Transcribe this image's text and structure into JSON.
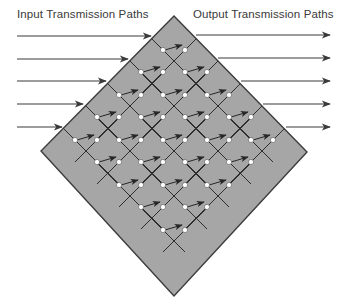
{
  "labels": {
    "input": "Input Transmission Paths",
    "output": "Output Transmission Paths"
  },
  "colors": {
    "background": "#ffffff",
    "diamond_fill": "#a6a6a6",
    "diamond_stroke": "#3c3c3c",
    "line": "#2e2e2e",
    "arrow": "#262626",
    "input_arrow": "#3a3a3a",
    "output_arrow": "#3a3a3a",
    "node_fill": "#ffffff",
    "node_stroke": "#555555"
  },
  "diamond": {
    "top": [
      174,
      16
    ],
    "right": [
      307,
      152
    ],
    "bottom": [
      174,
      296
    ],
    "left": [
      41,
      151
    ]
  },
  "input_paths": [
    {
      "y": 36,
      "x_start": 17,
      "x_end": 151,
      "edge_x": 154
    },
    {
      "y": 59,
      "x_start": 17,
      "x_end": 128,
      "edge_x": 132
    },
    {
      "y": 81,
      "x_start": 17,
      "x_end": 106,
      "edge_x": 110
    },
    {
      "y": 104,
      "x_start": 17,
      "x_end": 83,
      "edge_x": 88
    },
    {
      "y": 127,
      "x_start": 17,
      "x_end": 62,
      "edge_x": 65
    }
  ],
  "output_paths": [
    {
      "y": 35,
      "x_start": 196,
      "x_end": 330
    },
    {
      "y": 58,
      "x_start": 218,
      "x_end": 330
    },
    {
      "y": 81,
      "x_start": 241,
      "x_end": 330
    },
    {
      "y": 104,
      "x_start": 263,
      "x_end": 330
    },
    {
      "y": 127,
      "x_start": 286,
      "x_end": 330
    }
  ],
  "node_pairs": [
    {
      "row": 0,
      "y": 50,
      "pairs": [
        [
          163,
          185
        ]
      ]
    },
    {
      "row": 1,
      "y": 72,
      "pairs": [
        [
          141,
          163
        ],
        [
          185,
          207
        ]
      ]
    },
    {
      "row": 2,
      "y": 95,
      "pairs": [
        [
          119,
          141
        ],
        [
          163,
          185
        ],
        [
          207,
          229
        ]
      ]
    },
    {
      "row": 3,
      "y": 117,
      "pairs": [
        [
          97,
          119
        ],
        [
          141,
          163
        ],
        [
          185,
          207
        ],
        [
          229,
          251
        ]
      ]
    },
    {
      "row": 4,
      "y": 140,
      "pairs": [
        [
          75,
          97
        ],
        [
          119,
          141
        ],
        [
          163,
          185
        ],
        [
          207,
          229
        ],
        [
          251,
          273
        ]
      ]
    },
    {
      "row": 5,
      "y": 162,
      "pairs": [
        [
          97,
          119
        ],
        [
          141,
          163
        ],
        [
          185,
          207
        ],
        [
          229,
          251
        ]
      ]
    },
    {
      "row": 6,
      "y": 185,
      "pairs": [
        [
          119,
          141
        ],
        [
          163,
          185
        ],
        [
          207,
          229
        ]
      ]
    },
    {
      "row": 7,
      "y": 207,
      "pairs": [
        [
          141,
          163
        ],
        [
          185,
          207
        ]
      ]
    },
    {
      "row": 8,
      "y": 230,
      "pairs": [
        [
          163,
          185
        ]
      ]
    }
  ],
  "grid": {
    "step": 22.5,
    "line_extend": 22
  }
}
